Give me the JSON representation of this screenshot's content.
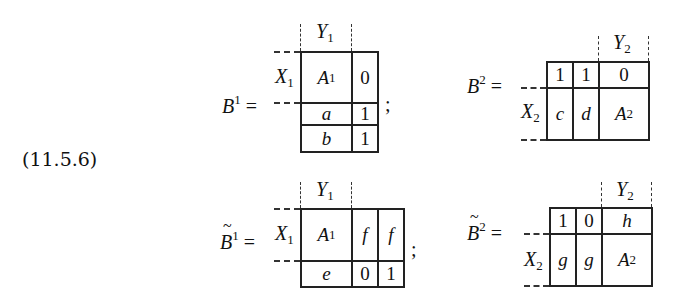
{
  "equation_label": "(11.5.6)",
  "matrices": {
    "B1": {
      "name": "B",
      "sup": "1",
      "tilde": false,
      "eq": "=",
      "punct": ";",
      "row_label": {
        "base": "X",
        "sub": "1"
      },
      "col_label": {
        "base": "Y",
        "sub": "1"
      },
      "cells": [
        {
          "text": "A",
          "sup": "1",
          "italic": true
        },
        {
          "text": "0",
          "italic": false
        },
        {
          "text": "a",
          "italic": true
        },
        {
          "text": "1",
          "italic": false
        },
        {
          "text": "b",
          "italic": true
        },
        {
          "text": "1",
          "italic": false
        }
      ]
    },
    "B2": {
      "name": "B",
      "sup": "2",
      "tilde": false,
      "eq": "=",
      "row_label": {
        "base": "X",
        "sub": "2"
      },
      "col_label": {
        "base": "Y",
        "sub": "2"
      },
      "cells": [
        {
          "text": "1",
          "italic": false
        },
        {
          "text": "1",
          "italic": false
        },
        {
          "text": "0",
          "italic": false
        },
        {
          "text": "c",
          "italic": true
        },
        {
          "text": "d",
          "italic": true
        },
        {
          "text": "A",
          "sup": "2",
          "italic": true
        }
      ]
    },
    "Bt1": {
      "name": "B",
      "sup": "1",
      "tilde": true,
      "eq": "=",
      "punct": ";",
      "row_label": {
        "base": "X",
        "sub": "1"
      },
      "col_label": {
        "base": "Y",
        "sub": "1"
      },
      "cells": [
        {
          "text": "A",
          "sup": "1",
          "italic": true
        },
        {
          "text": "f",
          "italic": true
        },
        {
          "text": "f",
          "italic": true
        },
        {
          "text": "e",
          "italic": true
        },
        {
          "text": "0",
          "italic": false
        },
        {
          "text": "1",
          "italic": false
        }
      ]
    },
    "Bt2": {
      "name": "B",
      "sup": "2",
      "tilde": true,
      "eq": "=",
      "row_label": {
        "base": "X",
        "sub": "2"
      },
      "col_label": {
        "base": "Y",
        "sub": "2"
      },
      "cells": [
        {
          "text": "1",
          "italic": false
        },
        {
          "text": "0",
          "italic": false
        },
        {
          "text": "h",
          "italic": true
        },
        {
          "text": "g",
          "italic": true
        },
        {
          "text": "g",
          "italic": true
        },
        {
          "text": "A",
          "sup": "2",
          "italic": true
        }
      ]
    }
  }
}
